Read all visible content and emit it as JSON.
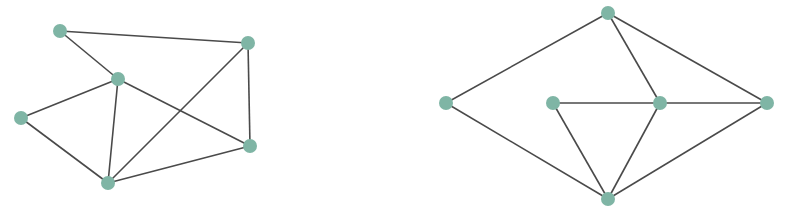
{
  "style": {
    "node_color": "#7fb5a5",
    "edge_color": "#4a4a4a",
    "node_radius": 7,
    "edge_width": 1.6
  },
  "graphs": [
    {
      "name": "graph-left",
      "nodes": [
        {
          "id": "A",
          "x": 60,
          "y": 31
        },
        {
          "id": "B",
          "x": 248,
          "y": 43
        },
        {
          "id": "C",
          "x": 118,
          "y": 79
        },
        {
          "id": "D",
          "x": 21,
          "y": 118
        },
        {
          "id": "E",
          "x": 250,
          "y": 146
        },
        {
          "id": "F",
          "x": 108,
          "y": 183
        }
      ],
      "edges": [
        [
          "A",
          "B"
        ],
        [
          "A",
          "C"
        ],
        [
          "C",
          "D"
        ],
        [
          "C",
          "E"
        ],
        [
          "C",
          "F"
        ],
        [
          "D",
          "F"
        ],
        [
          "B",
          "E"
        ],
        [
          "B",
          "F"
        ],
        [
          "E",
          "F"
        ]
      ]
    },
    {
      "name": "graph-right",
      "nodes": [
        {
          "id": "P",
          "x": 608,
          "y": 13
        },
        {
          "id": "Q",
          "x": 446,
          "y": 103
        },
        {
          "id": "R",
          "x": 553,
          "y": 103
        },
        {
          "id": "S",
          "x": 660,
          "y": 103
        },
        {
          "id": "T",
          "x": 767,
          "y": 103
        },
        {
          "id": "U",
          "x": 608,
          "y": 199
        }
      ],
      "edges": [
        [
          "P",
          "Q"
        ],
        [
          "P",
          "S"
        ],
        [
          "P",
          "T"
        ],
        [
          "Q",
          "U"
        ],
        [
          "R",
          "S"
        ],
        [
          "R",
          "U"
        ],
        [
          "S",
          "T"
        ],
        [
          "S",
          "U"
        ],
        [
          "T",
          "U"
        ]
      ]
    }
  ]
}
